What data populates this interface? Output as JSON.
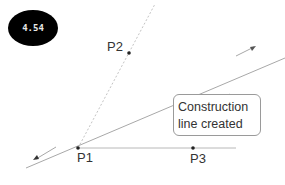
{
  "badge": {
    "value": "4.54"
  },
  "points": {
    "p1": {
      "label": "P1",
      "x": 78,
      "y": 148
    },
    "p2": {
      "label": "P2",
      "x": 129,
      "y": 53
    },
    "p3": {
      "label": "P3",
      "x": 193,
      "y": 148
    }
  },
  "callout": {
    "line1": "Construction",
    "line2": "line created"
  },
  "colors": {
    "line": "#a0a0a0",
    "dotted_line": "#c8c8c8",
    "point": "#222222",
    "badge_bg": "#000000",
    "badge_text": "#e8e8e8"
  }
}
